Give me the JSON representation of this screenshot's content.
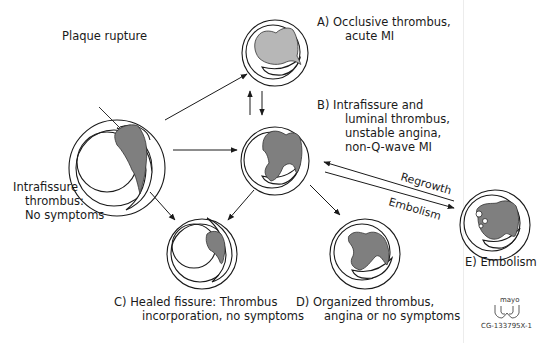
{
  "diagram": {
    "colors": {
      "thrombus_dark": "#7f7f7f",
      "thrombus_light": "#b7b7b7",
      "line": "#1a1a1a",
      "background": "#ffffff"
    },
    "origin": {
      "pointer_label": "Plaque rupture",
      "caption_lines": [
        "Intrafissure",
        "thrombus:",
        "No symptoms"
      ]
    },
    "outcomes": {
      "A": {
        "lines": [
          "A) Occlusive thrombus,",
          "acute MI"
        ]
      },
      "B": {
        "lines": [
          "B) Intrafissure and",
          "luminal thrombus,",
          "unstable angina,",
          "non-Q-wave MI"
        ]
      },
      "C": {
        "lines": [
          "C) Healed fissure: Thrombus",
          "incorporation, no symptoms"
        ]
      },
      "D": {
        "lines": [
          "D) Organized thrombus,",
          "angina or no symptoms"
        ]
      },
      "E": {
        "lines": [
          "E) Embolism"
        ]
      }
    },
    "arrow_labels": {
      "regrowth": "Regrowth",
      "embolism": "Embolism"
    },
    "credit": {
      "logo_text": "mayo",
      "code": "CG-133795X-1"
    }
  }
}
